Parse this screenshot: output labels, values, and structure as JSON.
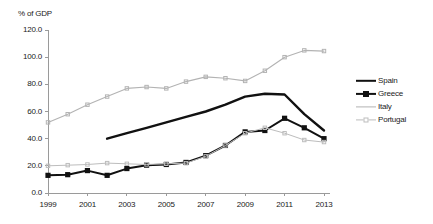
{
  "chart_data": {
    "type": "line",
    "title": "",
    "subtitle": "",
    "ylabel": "% of GDP",
    "xlabel": "",
    "ylim": [
      0.0,
      120.0
    ],
    "ytick_step": 20.0,
    "ytick_labels": [
      "120.0",
      "100.0",
      "80.0",
      "60.0",
      "40.0",
      "20.0",
      "0.0"
    ],
    "ytick_values": [
      120.0,
      100.0,
      80.0,
      60.0,
      40.0,
      20.0,
      0.0
    ],
    "xlim": [
      1999,
      2013
    ],
    "x": [
      1999,
      2000,
      2001,
      2002,
      2003,
      2004,
      2005,
      2006,
      2007,
      2008,
      2009,
      2010,
      2011,
      2012,
      2013
    ],
    "xtick_labels": [
      "1999",
      "2001",
      "2003",
      "2005",
      "2007",
      "2009",
      "2011",
      "2013"
    ],
    "xtick_values": [
      1999,
      2001,
      2003,
      2005,
      2007,
      2009,
      2011,
      2013
    ],
    "grid": false,
    "legend_position": "right",
    "series": [
      {
        "name": "Spain",
        "color": "#111111",
        "style": "thick-line",
        "marker": "none",
        "x": [
          2002,
          2003,
          2004,
          2005,
          2006,
          2007,
          2008,
          2009,
          2010,
          2011,
          2012,
          2013
        ],
        "values": [
          40.0,
          44.0,
          48.0,
          52.0,
          56.0,
          60.0,
          65.0,
          71.0,
          73.0,
          72.5,
          58.0,
          46.0
        ]
      },
      {
        "name": "Greece",
        "color": "#111111",
        "style": "line-marker",
        "marker": "square",
        "x": [
          1999,
          2000,
          2001,
          2002,
          2003,
          2004,
          2005,
          2006,
          2007,
          2008,
          2009,
          2010,
          2011,
          2012,
          2013
        ],
        "values": [
          13.0,
          13.5,
          16.5,
          13.0,
          18.0,
          20.5,
          21.0,
          22.5,
          27.5,
          35.0,
          45.0,
          46.0,
          55.0,
          48.0,
          40.0
        ]
      },
      {
        "name": "Italy",
        "color": "#b3b3b3",
        "style": "thin-line-marker",
        "marker": "tick",
        "x": [
          1999,
          2000,
          2001,
          2002,
          2003,
          2004,
          2005,
          2006,
          2007,
          2008,
          2009,
          2010,
          2011,
          2012,
          2013
        ],
        "values": [
          52.0,
          58.0,
          65.0,
          71.0,
          77.0,
          78.0,
          77.0,
          82.0,
          85.5,
          84.5,
          82.5,
          90.0,
          100.0,
          105.0,
          104.5
        ]
      },
      {
        "name": "Portugal",
        "color": "#bdbdbd",
        "style": "thin-line",
        "marker": "tick",
        "x": [
          1999,
          2000,
          2001,
          2002,
          2003,
          2004,
          2005,
          2006,
          2007,
          2008,
          2009,
          2010,
          2011,
          2012,
          2013
        ],
        "values": [
          20.0,
          20.5,
          21.0,
          22.0,
          21.5,
          21.0,
          21.5,
          22.0,
          27.0,
          35.0,
          44.0,
          48.0,
          44.0,
          39.0,
          37.5
        ]
      }
    ],
    "legend": [
      "Spain",
      "Greece",
      "Italy",
      "Portugal"
    ]
  }
}
